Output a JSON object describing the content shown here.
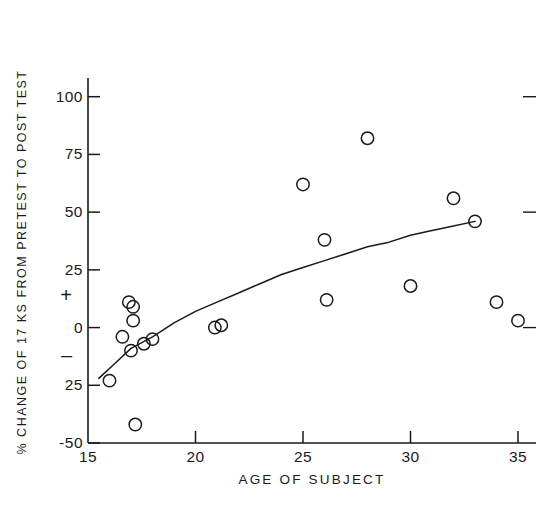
{
  "chart_data": {
    "type": "scatter",
    "title": "",
    "xlabel": "AGE OF SUBJECT",
    "ylabel": "% CHANGE OF 17 KS FROM PRETEST TO POST TEST",
    "xlim": [
      15,
      35
    ],
    "ylim": [
      -50,
      112
    ],
    "grid": false,
    "legend": null,
    "xticks": [
      15,
      20,
      25,
      30,
      35
    ],
    "xtick_labels": [
      "15",
      "20",
      "25",
      "30",
      "35"
    ],
    "yticks": [
      100,
      75,
      50,
      25,
      0,
      -25,
      -50
    ],
    "ytick_labels": [
      "100",
      "75",
      "50",
      "25",
      "0",
      "25",
      "-50"
    ],
    "y_sign_markers": [
      {
        "label": "+",
        "value": 14
      },
      {
        "label": "–",
        "value": -12
      }
    ],
    "right_edge_ticks": [
      100,
      50,
      0
    ],
    "marker": "open-circle",
    "points": [
      {
        "x": 16.0,
        "y": -23
      },
      {
        "x": 16.6,
        "y": -4
      },
      {
        "x": 16.9,
        "y": 11
      },
      {
        "x": 17.1,
        "y": 9
      },
      {
        "x": 17.0,
        "y": -10
      },
      {
        "x": 17.1,
        "y": 3
      },
      {
        "x": 17.2,
        "y": -42
      },
      {
        "x": 17.6,
        "y": -7
      },
      {
        "x": 18.0,
        "y": -5
      },
      {
        "x": 20.9,
        "y": 0
      },
      {
        "x": 21.2,
        "y": 1
      },
      {
        "x": 25.0,
        "y": 62
      },
      {
        "x": 26.0,
        "y": 38
      },
      {
        "x": 26.1,
        "y": 12
      },
      {
        "x": 28.0,
        "y": 82
      },
      {
        "x": 30.0,
        "y": 18
      },
      {
        "x": 32.0,
        "y": 56
      },
      {
        "x": 33.0,
        "y": 46
      },
      {
        "x": 34.0,
        "y": 11
      },
      {
        "x": 35.0,
        "y": 3
      }
    ],
    "fit_curve": {
      "description": "monotone increasing logarithmic trend line",
      "points": [
        {
          "x": 15.5,
          "y": -22
        },
        {
          "x": 16.2,
          "y": -16
        },
        {
          "x": 17.0,
          "y": -9
        },
        {
          "x": 18.0,
          "y": -4
        },
        {
          "x": 19.0,
          "y": 2
        },
        {
          "x": 20.0,
          "y": 7
        },
        {
          "x": 21.0,
          "y": 11
        },
        {
          "x": 22.0,
          "y": 15
        },
        {
          "x": 23.0,
          "y": 19
        },
        {
          "x": 24.0,
          "y": 23
        },
        {
          "x": 25.0,
          "y": 26
        },
        {
          "x": 26.0,
          "y": 29
        },
        {
          "x": 27.0,
          "y": 32
        },
        {
          "x": 28.0,
          "y": 35
        },
        {
          "x": 29.0,
          "y": 37
        },
        {
          "x": 30.0,
          "y": 40
        },
        {
          "x": 31.0,
          "y": 42
        },
        {
          "x": 32.0,
          "y": 44
        },
        {
          "x": 33.0,
          "y": 46
        }
      ]
    }
  }
}
